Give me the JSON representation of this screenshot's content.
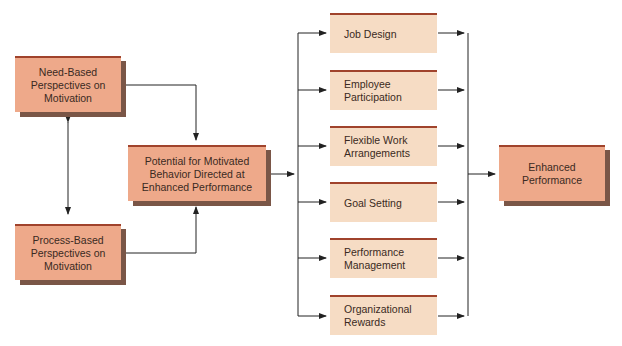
{
  "diagram": {
    "inputs": {
      "need_based": "Need-Based Perspectives on Motivation",
      "process_based": "Process-Based Perspectives on Motivation"
    },
    "center": "Potential for Motivated Behavior Directed at Enhanced Performance",
    "methods": [
      {
        "label": "Job Design"
      },
      {
        "label": "Employee Participation"
      },
      {
        "label": "Flexible Work Arrangements"
      },
      {
        "label": "Goal Setting"
      },
      {
        "label": "Performance Management"
      },
      {
        "label": "Organizational Rewards"
      }
    ],
    "outcome": "Enhanced Performance",
    "colors": {
      "dark_box": "#eea98a",
      "light_box": "#f6dcc4",
      "top_border": "#a0432c",
      "shadow": "#7a5647",
      "line": "#222222"
    }
  }
}
